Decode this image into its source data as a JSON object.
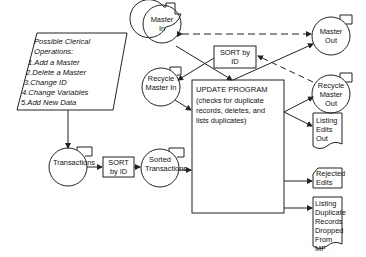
{
  "clerical_ops": {
    "title": "Possible Clerical Operations:",
    "items": [
      "1.Add a Master",
      "2.Delete a Master",
      "3.Change ID",
      "4.Change Variables",
      "5.Add New Data"
    ]
  },
  "nodes": {
    "master_in": "Master In",
    "recycle_master_in": "Recycle Master In",
    "sort_top": "SORT by ID",
    "master_out": "Master Out",
    "recycle_master_out": "Recycle Master Out",
    "update_program": {
      "title": "UPDATE PROGRAM",
      "desc": "(checks for duplicate records, deletes, and lists duplicates)"
    },
    "transactions": "Transactions",
    "sort_bottom": "SORT by ID",
    "sorted_transactions": "Sorted Transactions",
    "listing_edits_out": "Listing Edits Out",
    "rejected_edits": "Rejected Edits",
    "listing_duplicates": "Listing Duplicate Records Dropped From MF"
  },
  "colors": {
    "line": "#222222",
    "background": "#ffffff"
  }
}
